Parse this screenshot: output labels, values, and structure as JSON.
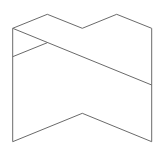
{
  "diagram": {
    "width": 163,
    "height": 150,
    "background": "#ffffff",
    "stroke_color": "#6a6a6a",
    "stroke_width": 1,
    "shapes": {
      "outline": {
        "label": "folded-ribbon-outline",
        "points": "12.7,141.7 12.7,28.3 47.3,14.3 82.3,28.3 116.7,14.3 151.7,28.3 151.7,141.7 82.3,113.3 12.7,141.7"
      },
      "diagonal_fold": {
        "label": "diagonal-fold-line",
        "points": "12.7,28.3 151.7,85"
      },
      "short_fold": {
        "label": "short-fold-line",
        "points": "12.7,56.7 47.3,42.7"
      }
    }
  }
}
